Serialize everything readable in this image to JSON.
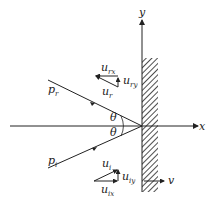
{
  "diagram": {
    "axes": {
      "x_label": "x",
      "y_label": "y"
    },
    "angles": {
      "top": "θ",
      "bottom": "θ"
    },
    "momenta": {
      "reflected": {
        "symbol": "p",
        "sub": "r"
      },
      "incident": {
        "symbol": "p",
        "sub": "i"
      }
    },
    "reflected_velocity": {
      "resultant": {
        "symbol": "u",
        "sub": "r"
      },
      "x_component": {
        "symbol": "u",
        "sub": "rx"
      },
      "y_component": {
        "symbol": "u",
        "sub": "ry"
      }
    },
    "incident_velocity": {
      "resultant": {
        "symbol": "u",
        "sub": "i"
      },
      "x_component": {
        "symbol": "u",
        "sub": "ix"
      },
      "y_component": {
        "symbol": "u",
        "sub": "iy"
      }
    },
    "wall_velocity": {
      "symbol": "v"
    },
    "colors": {
      "ink": "#222222",
      "background": "#ffffff"
    }
  }
}
